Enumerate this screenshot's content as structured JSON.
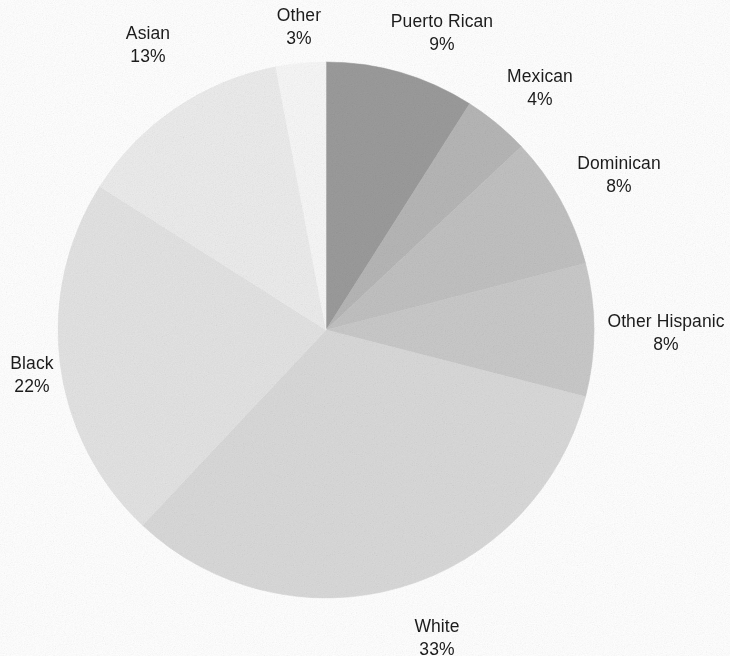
{
  "chart_data": {
    "type": "pie",
    "title": "",
    "subtitle": "",
    "xlabel": "",
    "ylabel": "",
    "legend_position": "none",
    "grid": false,
    "labels_show_percent": true,
    "start_angle_deg": 0,
    "direction": "clockwise",
    "categories": [
      "Puerto Rican",
      "Mexican",
      "Dominican",
      "Other Hispanic",
      "White",
      "Black",
      "Asian",
      "Other"
    ],
    "values": [
      9,
      4,
      8,
      8,
      33,
      22,
      13,
      3
    ],
    "value_labels": [
      "9%",
      "4%",
      "8%",
      "8%",
      "33%",
      "22%",
      "13%",
      "3%"
    ],
    "units": "percent",
    "total": 100,
    "colors": [
      "#9b9b9b",
      "#b6b6b6",
      "#c1c1c1",
      "#c9c9c9",
      "#d9d9d9",
      "#e3e3e3",
      "#ececec",
      "#f7f7f7"
    ],
    "slices": [
      {
        "label": "Puerto Rican",
        "value": 9,
        "pct_text": "9%",
        "color": "#9b9b9b"
      },
      {
        "label": "Mexican",
        "value": 4,
        "pct_text": "4%",
        "color": "#b6b6b6"
      },
      {
        "label": "Dominican",
        "value": 8,
        "pct_text": "8%",
        "color": "#c1c1c1"
      },
      {
        "label": "Other Hispanic",
        "value": 8,
        "pct_text": "8%",
        "color": "#c9c9c9"
      },
      {
        "label": "White",
        "value": 33,
        "pct_text": "33%",
        "color": "#d9d9d9"
      },
      {
        "label": "Black",
        "value": 22,
        "pct_text": "22%",
        "color": "#e3e3e3"
      },
      {
        "label": "Asian",
        "value": 13,
        "pct_text": "13%",
        "color": "#ececec"
      },
      {
        "label": "Other",
        "value": 3,
        "pct_text": "3%",
        "color": "#f7f7f7"
      }
    ],
    "geometry": {
      "center_x": 326,
      "center_y": 330,
      "radius": 268
    },
    "label_positions": [
      {
        "label": "Puerto Rican",
        "x": 442,
        "y": 10,
        "align": "center"
      },
      {
        "label": "Mexican",
        "x": 540,
        "y": 65,
        "align": "center"
      },
      {
        "label": "Dominican",
        "x": 619,
        "y": 152,
        "align": "center"
      },
      {
        "label": "Other Hispanic",
        "x": 666,
        "y": 310,
        "align": "center"
      },
      {
        "label": "White",
        "x": 437,
        "y": 615,
        "align": "center"
      },
      {
        "label": "Black",
        "x": 32,
        "y": 352,
        "align": "center"
      },
      {
        "label": "Asian",
        "x": 148,
        "y": 22,
        "align": "center"
      },
      {
        "label": "Other",
        "x": 299,
        "y": 4,
        "align": "center"
      }
    ]
  },
  "page": {
    "background_color": "#ffffff",
    "text_color": "#1c1c1c"
  }
}
